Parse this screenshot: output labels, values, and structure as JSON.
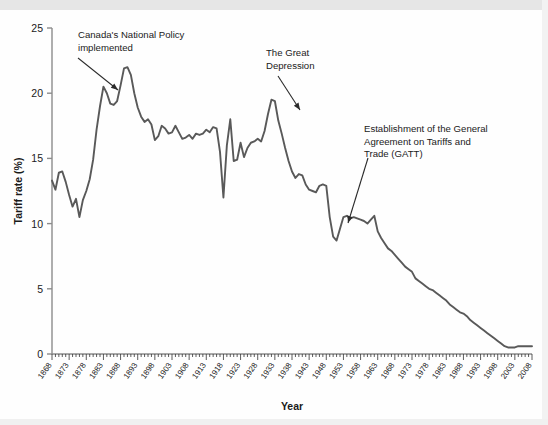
{
  "chart_data": {
    "type": "line",
    "title": "",
    "xlabel": "Year",
    "ylabel": "Tariff rate (%)",
    "xlim": [
      1868,
      2008
    ],
    "ylim": [
      0,
      25
    ],
    "yticks": [
      0,
      5,
      10,
      15,
      20,
      25
    ],
    "ytick_labels": [
      "0",
      "5",
      "10",
      "15",
      "20",
      "25"
    ],
    "xtick_labels": [
      "1868",
      "1873",
      "1878",
      "1883",
      "1888",
      "1893",
      "1898",
      "1903",
      "1908",
      "1913",
      "1918",
      "1923",
      "1928",
      "1933",
      "1938",
      "1943",
      "1948",
      "1953",
      "1958",
      "1963",
      "1968",
      "1973",
      "1978",
      "1983",
      "1988",
      "1993",
      "1998",
      "2003",
      "2008"
    ],
    "grid": false,
    "legend": "none",
    "line_color": "#595959",
    "axis_color": "#8c8c8c",
    "series": [
      {
        "name": "Tariff rate",
        "x": [
          1868,
          1869,
          1870,
          1871,
          1872,
          1873,
          1874,
          1875,
          1876,
          1877,
          1878,
          1879,
          1880,
          1881,
          1882,
          1883,
          1884,
          1885,
          1886,
          1887,
          1888,
          1889,
          1890,
          1891,
          1892,
          1893,
          1894,
          1895,
          1896,
          1897,
          1898,
          1899,
          1900,
          1901,
          1902,
          1903,
          1904,
          1905,
          1906,
          1907,
          1908,
          1909,
          1910,
          1911,
          1912,
          1913,
          1914,
          1915,
          1916,
          1917,
          1918,
          1919,
          1920,
          1921,
          1922,
          1923,
          1924,
          1925,
          1926,
          1927,
          1928,
          1929,
          1930,
          1931,
          1932,
          1933,
          1934,
          1935,
          1936,
          1937,
          1938,
          1939,
          1940,
          1941,
          1942,
          1943,
          1944,
          1945,
          1946,
          1947,
          1948,
          1949,
          1950,
          1951,
          1952,
          1953,
          1954,
          1955,
          1956,
          1957,
          1958,
          1959,
          1960,
          1961,
          1962,
          1963,
          1964,
          1965,
          1966,
          1967,
          1968,
          1969,
          1970,
          1971,
          1972,
          1973,
          1974,
          1975,
          1976,
          1977,
          1978,
          1979,
          1980,
          1981,
          1982,
          1983,
          1984,
          1985,
          1986,
          1987,
          1988,
          1989,
          1990,
          1991,
          1992,
          1993,
          1994,
          1995,
          1996,
          1997,
          1998,
          1999,
          2000,
          2001,
          2002,
          2003,
          2004,
          2005,
          2006,
          2007,
          2008
        ],
        "values": [
          13.3,
          12.6,
          13.9,
          14.0,
          13.2,
          12.2,
          11.3,
          11.9,
          10.5,
          11.8,
          12.5,
          13.4,
          14.9,
          17.2,
          19.0,
          20.5,
          20.0,
          19.2,
          19.1,
          19.4,
          20.6,
          21.9,
          22.0,
          21.4,
          20.0,
          18.9,
          18.2,
          17.8,
          18.0,
          17.6,
          16.4,
          16.7,
          17.5,
          17.3,
          16.9,
          17.0,
          17.5,
          17.0,
          16.5,
          16.6,
          16.8,
          16.5,
          16.9,
          16.8,
          16.9,
          17.2,
          17.0,
          17.4,
          17.3,
          15.5,
          12.0,
          16.0,
          18.0,
          14.8,
          14.9,
          16.2,
          15.1,
          15.8,
          16.2,
          16.3,
          16.5,
          16.3,
          17.1,
          18.4,
          19.5,
          19.4,
          17.9,
          16.9,
          15.8,
          14.8,
          14.0,
          13.5,
          13.8,
          13.7,
          13.0,
          12.6,
          12.5,
          12.4,
          12.9,
          13.0,
          12.9,
          10.5,
          9.0,
          8.7,
          9.6,
          10.5,
          10.6,
          10.4,
          10.5,
          10.4,
          10.3,
          10.2,
          10.0,
          10.3,
          10.6,
          9.4,
          8.9,
          8.5,
          8.1,
          7.9,
          7.6,
          7.3,
          7.0,
          6.7,
          6.5,
          6.3,
          5.8,
          5.6,
          5.4,
          5.2,
          5.0,
          4.9,
          4.7,
          4.5,
          4.3,
          4.1,
          3.8,
          3.6,
          3.4,
          3.2,
          3.1,
          2.9,
          2.6,
          2.4,
          2.2,
          2.0,
          1.8,
          1.6,
          1.4,
          1.2,
          1.0,
          0.8,
          0.6,
          0.5,
          0.5,
          0.5,
          0.6,
          0.6,
          0.6,
          0.6,
          0.6
        ]
      }
    ],
    "annotations": [
      {
        "text_lines": [
          "Canada's National Policy",
          "implemented"
        ],
        "target_year": 1883,
        "target_value": 20.5
      },
      {
        "text_lines": [
          "The Great",
          "Depression"
        ],
        "target_year": 1932,
        "target_value": 19.0
      },
      {
        "text_lines": [
          "Establishment of the General",
          "Agreement on Tariffs and",
          "Trade (GATT)"
        ],
        "target_year": 1953,
        "target_value": 10.6
      }
    ]
  }
}
